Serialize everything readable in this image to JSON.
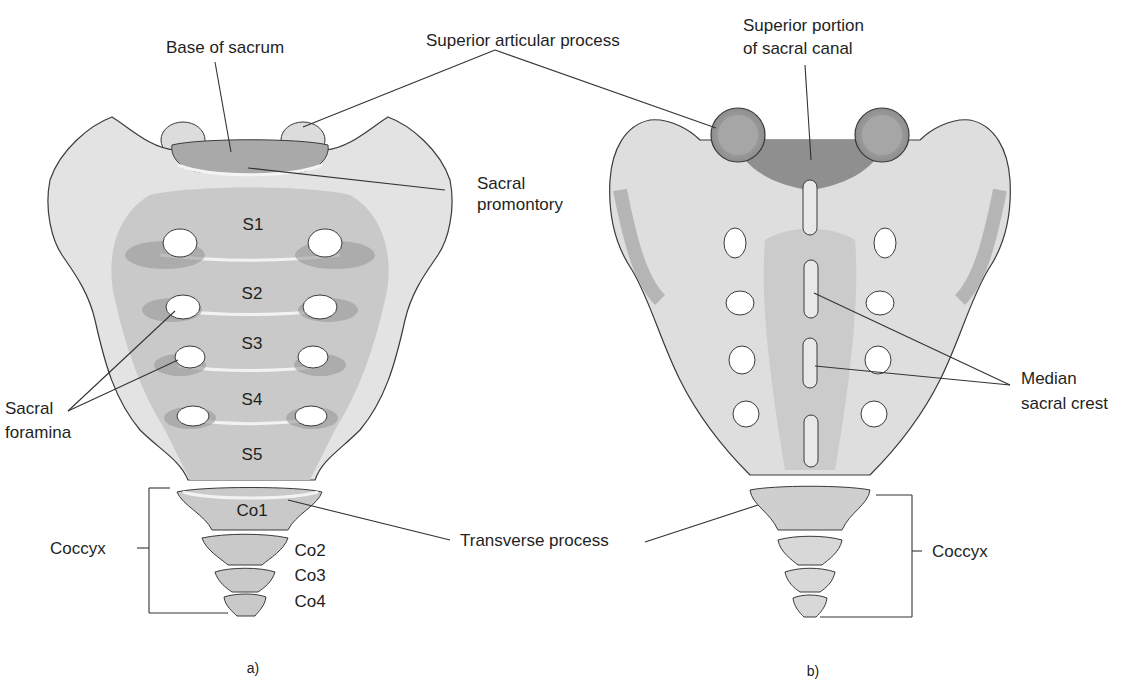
{
  "figure": {
    "colors": {
      "bone_light": "#e8e8e8",
      "bone_mid": "#c4c4c4",
      "bone_dark": "#8f8f8f",
      "outline": "#3a3a3a",
      "leader": "#333333"
    },
    "panel_a": {
      "caption": "a)",
      "labels": {
        "base_of_sacrum": "Base of sacrum",
        "superior_articular_process": "Superior articular process",
        "sacral_promontory_1": "Sacral",
        "sacral_promontory_2": "promontory",
        "sacral_foramina_1": "Sacral",
        "sacral_foramina_2": "foramina",
        "coccyx": "Coccyx",
        "transverse_process": "Transverse process"
      },
      "segments": [
        "S1",
        "S2",
        "S3",
        "S4",
        "S5"
      ],
      "coccygeal": [
        "Co1",
        "Co2",
        "Co3",
        "Co4"
      ]
    },
    "panel_b": {
      "caption": "b)",
      "labels": {
        "superior_portion_1": "Superior portion",
        "superior_portion_2": "of sacral canal",
        "median_sacral_crest_1": "Median",
        "median_sacral_crest_2": "sacral crest",
        "coccyx": "Coccyx"
      }
    }
  }
}
